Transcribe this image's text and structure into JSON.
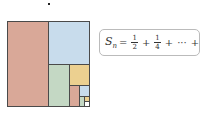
{
  "figure": {
    "colors": {
      "red": "#d9a898",
      "blue": "#c8dcec",
      "green": "#c4d8c4",
      "yellow": "#ecd090",
      "white": "#ffffff",
      "border": "#4a4a4a"
    },
    "formula": {
      "lhs": "S",
      "lhs_sub": "n",
      "equals": "=",
      "term1_num": "1",
      "term1_den": "2",
      "plus1": "+",
      "term2_num": "1",
      "term2_den": "4",
      "plus2": "+",
      "ellipsis": "···",
      "plus3": "+",
      "termn_num": "1",
      "termn_den": "2ⁿ"
    }
  }
}
